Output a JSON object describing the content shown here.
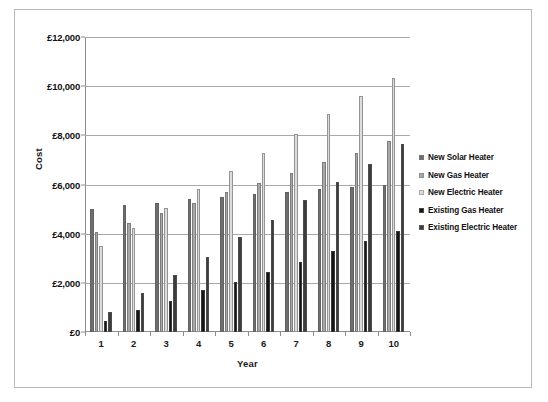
{
  "chart_data": {
    "type": "bar",
    "title": "",
    "xlabel": "Year",
    "ylabel": "Cost",
    "categories": [
      "1",
      "2",
      "3",
      "4",
      "5",
      "6",
      "7",
      "8",
      "9",
      "10"
    ],
    "ylim": [
      0,
      12000
    ],
    "ytick_values": [
      0,
      2000,
      4000,
      6000,
      8000,
      10000,
      12000
    ],
    "ytick_labels": [
      "£0",
      "£2,000",
      "£4,000",
      "£6,000",
      "£8,000",
      "£10,000",
      "£12,000"
    ],
    "grid": true,
    "legend_position": "right",
    "series": [
      {
        "name": "New Solar Heater",
        "color": "#6e6e6e",
        "values": [
          5000,
          5150,
          5250,
          5400,
          5500,
          5600,
          5700,
          5800,
          5900,
          6000
        ]
      },
      {
        "name": "New Gas Heater",
        "color": "#a8a8a8",
        "values": [
          4050,
          4450,
          4850,
          5250,
          5700,
          6050,
          6450,
          6900,
          7300,
          7750
        ]
      },
      {
        "name": "New Electric Heater",
        "color": "#dcdcdc",
        "values": [
          3500,
          4250,
          5050,
          5800,
          6550,
          7300,
          8050,
          8850,
          9600,
          10350
        ]
      },
      {
        "name": "Existing Gas Heater",
        "color": "#151515",
        "values": [
          450,
          900,
          1250,
          1700,
          2050,
          2450,
          2850,
          3300,
          3700,
          4100
        ]
      },
      {
        "name": "Existing Electric Heater",
        "color": "#3c3c3c",
        "values": [
          800,
          1600,
          2300,
          3050,
          3850,
          4550,
          5350,
          6100,
          6850,
          7650
        ]
      }
    ]
  }
}
